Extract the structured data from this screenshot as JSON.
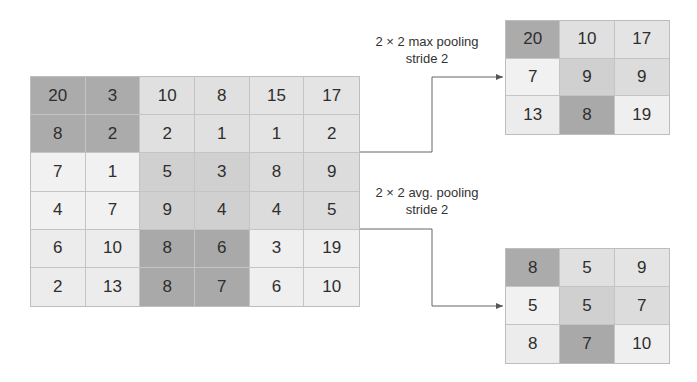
{
  "input": {
    "values": [
      [
        20,
        3,
        10,
        8,
        15,
        17
      ],
      [
        8,
        2,
        2,
        1,
        1,
        2
      ],
      [
        7,
        1,
        5,
        3,
        8,
        9
      ],
      [
        4,
        7,
        9,
        4,
        4,
        5
      ],
      [
        6,
        10,
        8,
        6,
        3,
        19
      ],
      [
        2,
        13,
        8,
        7,
        6,
        10
      ]
    ],
    "block_shades": [
      [
        "#ababab",
        "#e0e0e0",
        "#e4e4e4"
      ],
      [
        "#f1f1f1",
        "#d0d0d0",
        "#dcdcdc"
      ],
      [
        "#ececec",
        "#a9a9a9",
        "#efefef"
      ]
    ]
  },
  "max_pool": {
    "label_line1": "2 × 2 max pooling",
    "label_line2": "stride 2",
    "values": [
      [
        20,
        10,
        17
      ],
      [
        7,
        9,
        9
      ],
      [
        13,
        8,
        19
      ]
    ]
  },
  "avg_pool": {
    "label_line1": "2 × 2 avg. pooling",
    "label_line2": "stride 2",
    "values": [
      [
        8,
        5,
        9
      ],
      [
        5,
        5,
        7
      ],
      [
        8,
        7,
        10
      ]
    ]
  }
}
